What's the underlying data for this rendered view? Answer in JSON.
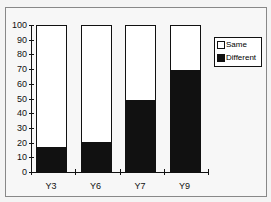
{
  "chart_data": {
    "type": "bar",
    "stacked": true,
    "title": "",
    "xlabel": "",
    "ylabel": "",
    "categories": [
      "Y3",
      "Y6",
      "Y7",
      "Y9"
    ],
    "series": [
      {
        "name": "Different",
        "color": "#111111",
        "values": [
          16,
          20,
          48,
          69
        ]
      },
      {
        "name": "Same",
        "color": "#ffffff",
        "values": [
          84,
          80,
          52,
          31
        ]
      }
    ],
    "ylim": [
      0,
      100
    ],
    "yticks": [
      0,
      10,
      20,
      30,
      40,
      50,
      60,
      70,
      80,
      90,
      100
    ],
    "grid": false,
    "legend": {
      "position": "right",
      "entries": [
        "Same",
        "Different"
      ]
    }
  },
  "legend": {
    "same": "Same",
    "different": "Different"
  }
}
